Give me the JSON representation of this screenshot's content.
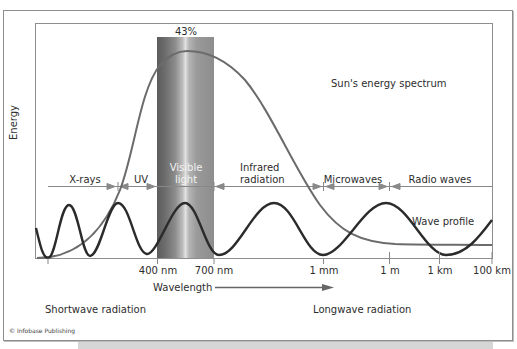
{
  "figure": {
    "y_axis_label": "Energy",
    "x_axis_label": "Wavelength",
    "peak_label": "43%",
    "curves": {
      "sun": {
        "label": "Sun's energy spectrum",
        "color": "#6b6b6b"
      },
      "wave": {
        "label": "Wave profile",
        "color": "#2b2b2b"
      }
    },
    "visible_band_color": "#8a8a8a",
    "regions": [
      {
        "name": "X-rays",
        "label": "X-rays"
      },
      {
        "name": "UV",
        "label": "UV"
      },
      {
        "name": "Visible light",
        "label_line1": "Visible",
        "label_line2": "light"
      },
      {
        "name": "Infrared radiation",
        "label_line1": "Infrared",
        "label_line2": "radiation"
      },
      {
        "name": "Microwaves",
        "label": "Microwaves"
      },
      {
        "name": "Radio waves",
        "label": "Radio waves"
      }
    ],
    "ticks": [
      "400 nm",
      "700 nm",
      "1 mm",
      "1 m",
      "1 km",
      "100 km"
    ],
    "shortwave_label": "Shortwave radiation",
    "longwave_label": "Longwave radiation",
    "credit": "© Infobase Publishing"
  }
}
